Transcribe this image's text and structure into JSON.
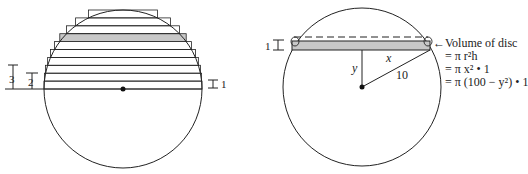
{
  "left_figure": {
    "labels": {
      "three": "3",
      "two": "2",
      "one": "1"
    },
    "slab_count": 10,
    "shaded_slab_index": 6
  },
  "right_figure": {
    "thickness_label": "1",
    "x_label": "x",
    "y_label": "y",
    "radius_label": "10",
    "annotation": {
      "arrow": "←",
      "line1": "Volume of disc",
      "line2": "= π r²h",
      "line3": "= π x² • 1",
      "line4": "= π (100 − y²) • 1"
    }
  },
  "colors": {
    "stroke": "#222222",
    "shade": "#c8c8c8"
  }
}
